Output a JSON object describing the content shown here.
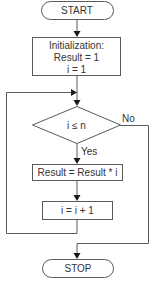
{
  "diagram": {
    "type": "flowchart",
    "nodes": {
      "start": {
        "shape": "terminal",
        "label": "START"
      },
      "init": {
        "shape": "process",
        "lines": [
          "Initialization:",
          "Result = 1",
          "i = 1"
        ]
      },
      "decision": {
        "shape": "decision",
        "label": "i ≤ n"
      },
      "multiply": {
        "shape": "process",
        "label": "Result = Result * i"
      },
      "increment": {
        "shape": "process",
        "label": "i = i + 1"
      },
      "stop": {
        "shape": "terminal",
        "label": "STOP"
      }
    },
    "edges": {
      "yes_label": "Yes",
      "no_label": "No"
    },
    "colors": {
      "stroke": "#5a5a5a",
      "arrowhead": "#1a1a1a",
      "text": "#333333",
      "background": "#ffffff"
    }
  }
}
